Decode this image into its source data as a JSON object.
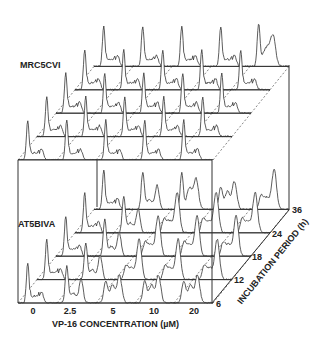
{
  "chart_data": {
    "type": "3d-stacked-histogram",
    "title": "",
    "xlabel": "VP-16 CONCENTRATION (µM)",
    "zlabel": "INCUBATION PERIOD (h)",
    "x_categories": [
      "0",
      "2.5",
      "5",
      "10",
      "20"
    ],
    "z_categories": [
      "6",
      "12",
      "18",
      "24",
      "36"
    ],
    "panels": [
      {
        "name": "MRC5CVI",
        "description": "DNA content histograms; dominant G1 peak with small G2/M shoulder across all doses and times",
        "histogram_shape": {
          "0": [
            "G1-dominant",
            "G1-dominant",
            "G1-dominant",
            "G1-dominant",
            "G1-dominant"
          ],
          "2.5": [
            "G1-dominant",
            "G1-dominant",
            "G1-dominant",
            "G1-dominant",
            "G1-dominant"
          ],
          "5": [
            "G1-dominant",
            "G1-dominant",
            "G1-dominant",
            "G1-dominant",
            "G1-dominant"
          ],
          "10": [
            "G1-dominant",
            "G1-dominant",
            "G1-dominant",
            "G1-dominant",
            "G1-dominant"
          ],
          "20": [
            "G1-dominant",
            "G1-dominant",
            "G1-dominant",
            "G1-dominant",
            "G1+broad S/G2"
          ]
        }
      },
      {
        "name": "AT5BIVA",
        "description": "DNA content histograms; shift from G1 to S/G2 accumulation with increasing dose and time",
        "histogram_shape": {
          "0": [
            "G1-dominant",
            "G1-dominant",
            "G1-dominant",
            "G1-dominant",
            "G1-dominant"
          ],
          "2.5": [
            "G1+G2",
            "G1+G2",
            "G1+G2",
            "G1+G2",
            "G1+G2"
          ],
          "5": [
            "S/G2 broad",
            "G2 peak",
            "G2 peak",
            "G2 peak",
            "G1+S/G2"
          ],
          "10": [
            "S/G2 broad",
            "G2 peak",
            "G2 peak",
            "G2 peak",
            "S/G2 broad"
          ],
          "20": [
            "S/G2 broad",
            "G2 peak",
            "G2 peak",
            "G2 peak",
            "G2 peak"
          ]
        }
      }
    ],
    "grid": false,
    "legend": null
  },
  "labels": {
    "panel_top": "MRC5CVI",
    "panel_bottom": "AT5BIVA",
    "x_axis_title": "VP-16 CONCENTRATION (µM)",
    "z_axis_title": "INCUBATION PERIOD (h)",
    "x_ticks": [
      "0",
      "2.5",
      "5",
      "10",
      "20"
    ],
    "z_ticks": [
      "6",
      "12",
      "18",
      "24",
      "36"
    ]
  },
  "colors": {
    "line": "#333333",
    "background": "#ffffff"
  }
}
